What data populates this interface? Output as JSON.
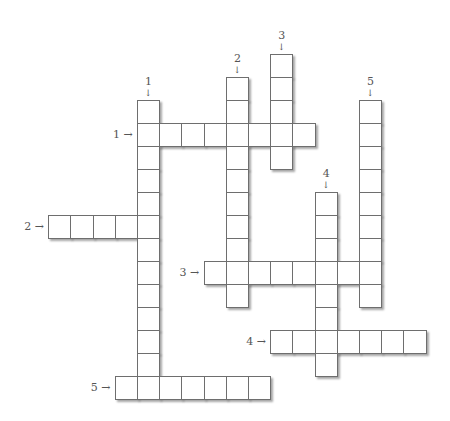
{
  "puzzle": {
    "type": "crossword",
    "grid": {
      "origin_x": 137,
      "origin_y": 123,
      "cell_w": 22.2,
      "cell_h": 23
    },
    "across": [
      {
        "number": "1",
        "row": 0,
        "col": 0,
        "length": 8
      },
      {
        "number": "2",
        "row": 4,
        "col": -4,
        "length": 5
      },
      {
        "number": "3",
        "row": 6,
        "col": 3,
        "length": 8
      },
      {
        "number": "4",
        "row": 9,
        "col": 6,
        "length": 7
      },
      {
        "number": "5",
        "row": 11,
        "col": -1,
        "length": 7
      }
    ],
    "down": [
      {
        "number": "1",
        "row": -1,
        "col": 0,
        "length": 13
      },
      {
        "number": "2",
        "row": -2,
        "col": 4,
        "length": 10
      },
      {
        "number": "3",
        "row": -3,
        "col": 6,
        "length": 5
      },
      {
        "number": "4",
        "row": 3,
        "col": 8,
        "length": 8
      },
      {
        "number": "5",
        "row": -1,
        "col": 10,
        "length": 9
      }
    ],
    "arrow_across": "→",
    "arrow_down": "↓"
  },
  "colors": {
    "border": "#6e6e6e",
    "label": "#555555",
    "background": "#ffffff"
  }
}
